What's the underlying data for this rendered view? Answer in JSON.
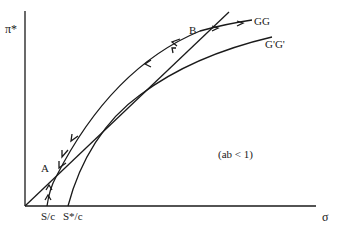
{
  "diagram": {
    "y_axis_label": "π*",
    "x_axis_label": "σ",
    "curves": [
      {
        "name": "GG",
        "label": "GG"
      },
      {
        "name": "G'G'",
        "label": "G'G'"
      }
    ],
    "points": [
      {
        "name": "A",
        "label": "A"
      },
      {
        "name": "B",
        "label": "B"
      }
    ],
    "x_ticks": [
      {
        "label": "S/c"
      },
      {
        "label": "S*/c"
      }
    ],
    "condition": "(ab < 1)",
    "colors": {
      "ink": "#1a1a1a",
      "background": "#ffffff"
    }
  }
}
